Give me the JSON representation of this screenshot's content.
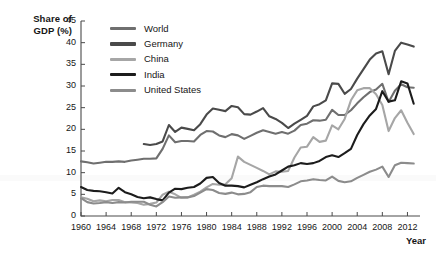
{
  "chart_data": {
    "type": "line",
    "title": "",
    "subtitle": "",
    "xlabel": "Year",
    "ylabel": "Share of GDP (%)",
    "ylabel_line1": "Share of",
    "ylabel_line2": "GDP (%)",
    "xlim": [
      1960,
      2014
    ],
    "ylim": [
      0,
      45
    ],
    "yticks": [
      0,
      5,
      10,
      15,
      20,
      25,
      30,
      35,
      40,
      45
    ],
    "xticks": [
      1960,
      1964,
      1968,
      1972,
      1976,
      1980,
      1984,
      1988,
      1992,
      1996,
      2000,
      2004,
      2008,
      2012
    ],
    "grid": false,
    "legend_position": "top-left-inside",
    "x": [
      1960,
      1961,
      1962,
      1963,
      1964,
      1965,
      1966,
      1967,
      1968,
      1969,
      1970,
      1971,
      1972,
      1973,
      1974,
      1975,
      1976,
      1977,
      1978,
      1979,
      1980,
      1981,
      1982,
      1983,
      1984,
      1985,
      1986,
      1987,
      1988,
      1989,
      1990,
      1991,
      1992,
      1993,
      1994,
      1995,
      1996,
      1997,
      1998,
      1999,
      2000,
      2001,
      2002,
      2003,
      2004,
      2005,
      2006,
      2007,
      2008,
      2009,
      2010,
      2011,
      2012,
      2013
    ],
    "series": [
      {
        "name": "World",
        "color": "#6f6f6f",
        "x": [
          1960,
          1961,
          1962,
          1963,
          1964,
          1965,
          1966,
          1967,
          1968,
          1969,
          1970,
          1971,
          1972,
          1973,
          1974,
          1975,
          1976,
          1977,
          1978,
          1979,
          1980,
          1981,
          1982,
          1983,
          1984,
          1985,
          1986,
          1987,
          1988,
          1989,
          1990,
          1991,
          1992,
          1993,
          1994,
          1995,
          1996,
          1997,
          1998,
          1999,
          2000,
          2001,
          2002,
          2003,
          2004,
          2005,
          2006,
          2007,
          2008,
          2009,
          2010,
          2011,
          2012,
          2013
        ],
        "values": [
          12.6,
          12.4,
          12.1,
          12.3,
          12.5,
          12.5,
          12.6,
          12.5,
          12.8,
          13.0,
          13.2,
          13.2,
          13.3,
          15.5,
          18.6,
          17.0,
          17.3,
          17.3,
          17.2,
          18.7,
          19.6,
          19.5,
          18.6,
          18.2,
          18.9,
          18.6,
          17.8,
          18.5,
          19.2,
          19.8,
          19.4,
          19.0,
          19.4,
          19.0,
          19.7,
          21.0,
          21.3,
          22.1,
          22.0,
          22.2,
          24.5,
          23.3,
          23.3,
          24.4,
          26.0,
          27.4,
          28.6,
          29.2,
          30.5,
          26.3,
          28.9,
          30.4,
          29.7,
          29.6
        ]
      },
      {
        "name": "Germany",
        "color": "#4a4a4a",
        "x": [
          1970,
          1971,
          1972,
          1973,
          1974,
          1975,
          1976,
          1977,
          1978,
          1979,
          1980,
          1981,
          1982,
          1983,
          1984,
          1985,
          1986,
          1987,
          1988,
          1989,
          1990,
          1991,
          1992,
          1993,
          1994,
          1995,
          1996,
          1997,
          1998,
          1999,
          2000,
          2001,
          2002,
          2003,
          2004,
          2005,
          2006,
          2007,
          2008,
          2009,
          2010,
          2011,
          2012,
          2013
        ],
        "values": [
          16.6,
          16.4,
          16.6,
          17.2,
          21.0,
          19.4,
          20.4,
          20.1,
          19.8,
          21.2,
          23.4,
          24.8,
          24.5,
          24.2,
          25.4,
          25.1,
          23.5,
          23.4,
          24.1,
          24.9,
          23.0,
          22.4,
          21.5,
          20.3,
          21.3,
          22.2,
          23.1,
          25.3,
          25.8,
          26.7,
          30.6,
          30.5,
          28.2,
          29.3,
          31.7,
          33.9,
          36.1,
          37.5,
          38.0,
          32.7,
          38.1,
          40.0,
          39.6,
          39.1
        ]
      },
      {
        "name": "China",
        "color": "#a6a6a6",
        "x": [
          1960,
          1961,
          1962,
          1963,
          1964,
          1965,
          1966,
          1967,
          1968,
          1969,
          1970,
          1971,
          1972,
          1973,
          1974,
          1975,
          1976,
          1977,
          1978,
          1979,
          1980,
          1981,
          1982,
          1983,
          1984,
          1985,
          1986,
          1987,
          1988,
          1989,
          1990,
          1991,
          1992,
          1993,
          1994,
          1995,
          1996,
          1997,
          1998,
          1999,
          2000,
          2001,
          2002,
          2003,
          2004,
          2005,
          2006,
          2007,
          2008,
          2009,
          2010,
          2011,
          2012,
          2013
        ],
        "values": [
          4.3,
          4.0,
          3.4,
          3.6,
          3.4,
          3.7,
          3.7,
          3.2,
          3.1,
          3.0,
          2.6,
          2.8,
          3.1,
          4.9,
          5.6,
          5.0,
          4.2,
          4.3,
          4.9,
          5.6,
          6.6,
          7.4,
          7.2,
          7.3,
          8.7,
          13.7,
          12.5,
          11.8,
          11.1,
          10.4,
          9.6,
          10.3,
          10.2,
          10.4,
          13.5,
          15.8,
          16.0,
          18.2,
          17.1,
          17.4,
          20.9,
          20.0,
          22.4,
          26.7,
          29.0,
          29.5,
          29.5,
          28.1,
          25.6,
          19.6,
          22.6,
          24.4,
          21.5,
          18.9
        ]
      },
      {
        "name": "India",
        "color": "#1c1c1c",
        "x": [
          1960,
          1961,
          1962,
          1963,
          1964,
          1965,
          1966,
          1967,
          1968,
          1969,
          1970,
          1971,
          1972,
          1973,
          1974,
          1975,
          1976,
          1977,
          1978,
          1979,
          1980,
          1981,
          1982,
          1983,
          1984,
          1985,
          1986,
          1987,
          1988,
          1989,
          1990,
          1991,
          1992,
          1993,
          1994,
          1995,
          1996,
          1997,
          1998,
          1999,
          2000,
          2001,
          2002,
          2003,
          2004,
          2005,
          2006,
          2007,
          2008,
          2009,
          2010,
          2011,
          2012,
          2013
        ],
        "values": [
          6.7,
          6.0,
          5.8,
          5.7,
          5.5,
          5.2,
          6.5,
          5.5,
          5.0,
          4.4,
          4.1,
          4.3,
          3.9,
          3.6,
          5.4,
          6.3,
          6.2,
          6.5,
          6.7,
          7.5,
          8.8,
          9.0,
          7.6,
          7.0,
          7.0,
          6.9,
          6.6,
          7.2,
          7.8,
          8.5,
          9.1,
          9.6,
          10.5,
          11.4,
          11.7,
          12.2,
          12.0,
          12.2,
          12.7,
          13.6,
          14.0,
          13.6,
          14.5,
          15.5,
          18.7,
          21.2,
          23.2,
          24.7,
          28.8,
          26.4,
          26.7,
          31.1,
          30.6,
          25.9
        ]
      },
      {
        "name": "United States",
        "color": "#8c8c8c",
        "x": [
          1960,
          1961,
          1962,
          1963,
          1964,
          1965,
          1966,
          1967,
          1968,
          1969,
          1970,
          1971,
          1972,
          1973,
          1974,
          1975,
          1976,
          1977,
          1978,
          1979,
          1980,
          1981,
          1982,
          1983,
          1984,
          1985,
          1986,
          1987,
          1988,
          1989,
          1990,
          1991,
          1992,
          1993,
          1994,
          1995,
          1996,
          1997,
          1998,
          1999,
          2000,
          2001,
          2002,
          2003,
          2004,
          2005,
          2006,
          2007,
          2008,
          2009,
          2010,
          2011,
          2012,
          2013
        ],
        "values": [
          4.1,
          3.2,
          2.9,
          3.0,
          3.2,
          3.0,
          3.2,
          3.1,
          3.3,
          3.3,
          3.3,
          2.6,
          2.2,
          3.2,
          4.5,
          4.2,
          4.3,
          4.3,
          4.6,
          5.4,
          6.2,
          6.0,
          5.3,
          5.1,
          5.4,
          5.0,
          5.1,
          5.5,
          6.7,
          7.0,
          6.9,
          6.9,
          6.9,
          6.7,
          7.3,
          8.0,
          8.2,
          8.5,
          8.3,
          8.2,
          9.1,
          8.1,
          7.8,
          8.0,
          8.8,
          9.5,
          10.2,
          10.7,
          11.4,
          9.0,
          11.7,
          12.3,
          12.2,
          12.1
        ]
      }
    ]
  },
  "legend": {
    "items": [
      {
        "label": "World",
        "color": "#6f6f6f"
      },
      {
        "label": "Germany",
        "color": "#4a4a4a"
      },
      {
        "label": "China",
        "color": "#a6a6a6"
      },
      {
        "label": "India",
        "color": "#1c1c1c"
      },
      {
        "label": "United States",
        "color": "#8c8c8c"
      }
    ]
  },
  "axes": {
    "y_title_line1": "Share of",
    "y_title_line2": "GDP (%)",
    "x_title": "Year",
    "ytick_labels": [
      "45",
      "40",
      "35",
      "30",
      "25",
      "20",
      "15",
      "10",
      "5",
      "0"
    ],
    "xtick_labels": [
      "1960",
      "1964",
      "1968",
      "1972",
      "1976",
      "1980",
      "1984",
      "1988",
      "1992",
      "1996",
      "2000",
      "2004",
      "2008",
      "2012"
    ]
  }
}
